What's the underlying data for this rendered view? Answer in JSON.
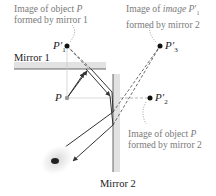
{
  "diagram": {
    "labels": {
      "mirror1": "Mirror 1",
      "mirror2": "Mirror 2",
      "object": "P",
      "image1": "P",
      "image1_sub": "1",
      "image2": "P",
      "image2_sub": "2",
      "image3": "P",
      "image3_sub": "3",
      "prime": "′"
    },
    "annotations": {
      "image1": {
        "line1_a": "Image of object ",
        "line1_b": "P",
        "line2": "formed by mirror 1"
      },
      "image3": {
        "line1_a": "Image of ",
        "line1_b": "image P",
        "line1_c": "′",
        "line1_sub": "1",
        "line2": "formed by mirror 2"
      },
      "image2": {
        "line1_a": "Image of object ",
        "line1_b": "P",
        "line2": "formed by mirror 2"
      }
    },
    "colors": {
      "ray": "#333333",
      "mirror_band": "#e2e2e2",
      "mirror_line": "#444444",
      "guide": "#c8c8c8",
      "annotation_text": "#7a7a7a",
      "point": "#111111"
    }
  }
}
